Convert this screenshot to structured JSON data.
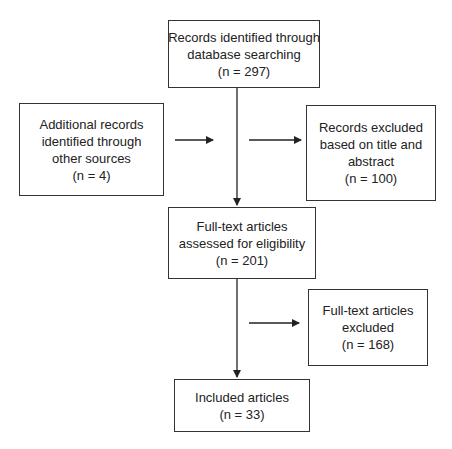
{
  "diagram": {
    "type": "flowchart",
    "boxes": {
      "database": {
        "lines": [
          "Records identified through",
          "database searching",
          "(n = 297)"
        ]
      },
      "additional": {
        "lines": [
          "Additional records",
          "identified through",
          "other sources",
          "(n = 4)"
        ]
      },
      "excluded_title": {
        "lines": [
          "Records excluded",
          "based on title and",
          "abstract",
          "(n = 100)"
        ]
      },
      "fulltext_assessed": {
        "lines": [
          "Full-text articles",
          "assessed for eligibility",
          "(n = 201)"
        ]
      },
      "fulltext_excluded": {
        "lines": [
          "Full-text articles",
          "excluded",
          "(n = 168)"
        ]
      },
      "included": {
        "lines": [
          "Included articles",
          "(n = 33)"
        ]
      }
    },
    "counts": {
      "database": 297,
      "additional": 4,
      "excluded_title_abstract": 100,
      "fulltext_assessed": 201,
      "fulltext_excluded": 168,
      "included": 33
    },
    "colors": {
      "line": "#333333",
      "background": "#ffffff"
    }
  }
}
